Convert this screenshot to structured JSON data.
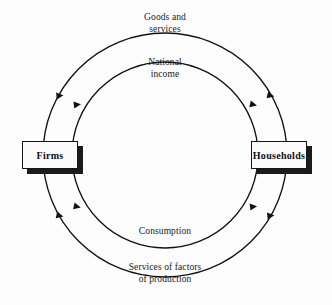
{
  "diagram": {
    "type": "circular-flow",
    "background_color": "#fdfdfd",
    "line_color": "#111111",
    "entities": [
      {
        "id": "firms",
        "label": "Firms",
        "x": 22,
        "y": 141,
        "width": 56,
        "height": 28
      },
      {
        "id": "households",
        "label": "Households",
        "x": 251,
        "y": 141,
        "width": 56,
        "height": 28
      }
    ],
    "flows": [
      {
        "id": "goods-services",
        "label": "Goods and\nservices",
        "ring": "outer",
        "half": "top",
        "direction": "firms-to-households"
      },
      {
        "id": "national-income",
        "label": "National\nincome",
        "ring": "inner",
        "half": "top",
        "direction": "firms-to-households"
      },
      {
        "id": "consumption",
        "label": "Consumption",
        "ring": "inner",
        "half": "bottom",
        "direction": "households-to-firms"
      },
      {
        "id": "services-of-factors",
        "label": "Services of factors\nof production",
        "ring": "outer",
        "half": "bottom",
        "direction": "households-to-firms"
      }
    ],
    "geometry": {
      "center_x": 165,
      "center_y": 155,
      "outer_radius": 122,
      "inner_radius": 93
    },
    "arrow_count": 8
  }
}
